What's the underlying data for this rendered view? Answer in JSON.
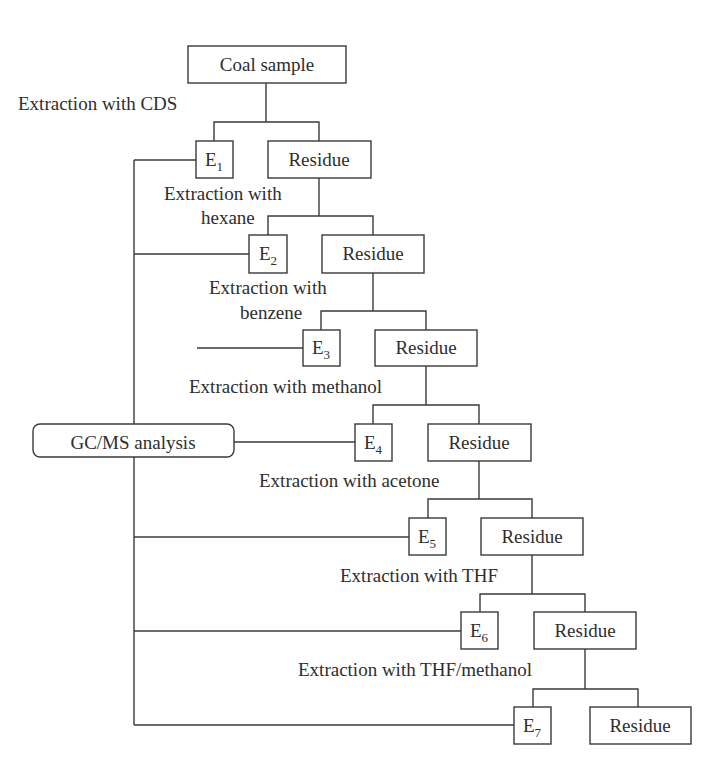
{
  "diagram": {
    "type": "flowchart",
    "start": "Coal sample",
    "analysis": "GC/MS analysis",
    "steps": [
      {
        "label_lines": [
          "Extraction with CDS"
        ],
        "extract": "E",
        "extract_sub": "1",
        "residue": "Residue"
      },
      {
        "label_lines": [
          "Extraction with",
          "hexane"
        ],
        "extract": "E",
        "extract_sub": "2",
        "residue": "Residue"
      },
      {
        "label_lines": [
          "Extraction with",
          "benzene"
        ],
        "extract": "E",
        "extract_sub": "3",
        "residue": "Residue"
      },
      {
        "label_lines": [
          "Extraction with methanol"
        ],
        "extract": "E",
        "extract_sub": "4",
        "residue": "Residue"
      },
      {
        "label_lines": [
          "Extraction with acetone"
        ],
        "extract": "E",
        "extract_sub": "5",
        "residue": "Residue"
      },
      {
        "label_lines": [
          "Extraction with THF"
        ],
        "extract": "E",
        "extract_sub": "6",
        "residue": "Residue"
      },
      {
        "label_lines": [
          "Extraction with THF/methanol"
        ],
        "extract": "E",
        "extract_sub": "7",
        "residue": "Residue"
      }
    ]
  }
}
